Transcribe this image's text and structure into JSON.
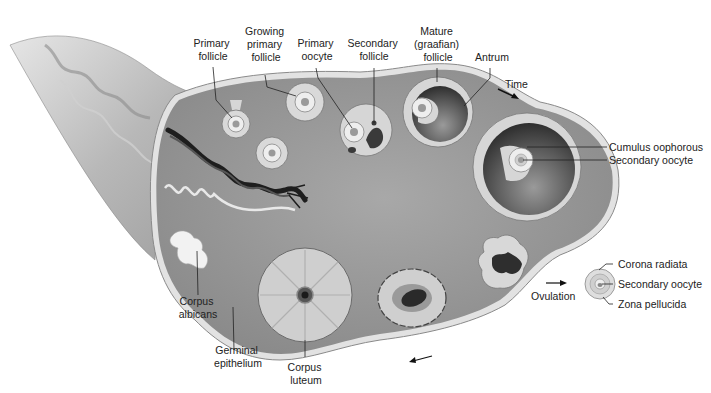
{
  "diagram": {
    "labels": {
      "primary_follicle": [
        "Primary",
        "follicle"
      ],
      "growing_primary_follicle": [
        "Growing",
        "primary",
        "follicle"
      ],
      "primary_oocyte": [
        "Primary",
        "oocyte"
      ],
      "secondary_follicle": [
        "Secondary",
        "follicle"
      ],
      "mature_follicle": [
        "Mature",
        "(graafian)",
        "follicle"
      ],
      "antrum": "Antrum",
      "time": "Time",
      "cumulus_oophorous": "Cumulus oophorous",
      "secondary_oocyte_in_follicle": "Secondary oocyte",
      "corona_radiata": "Corona radiata",
      "secondary_oocyte_released": "Secondary oocyte",
      "zona_pellucida": "Zona pellucida",
      "ovulation": "Ovulation",
      "corpus_albicans": [
        "Corpus",
        "albicans"
      ],
      "germinal_epithelium": [
        "Germinal",
        "epithelium"
      ],
      "corpus_luteum": [
        "Corpus",
        "luteum"
      ]
    },
    "colors": {
      "tissue": "#9a9a9a",
      "tissue_dark": "#7e7e7e",
      "capsule": "#d8d8d8",
      "granulosa": "#dcdcdc",
      "antrum": "#4a4a4a",
      "text": "#222222",
      "background": "#ffffff"
    }
  }
}
